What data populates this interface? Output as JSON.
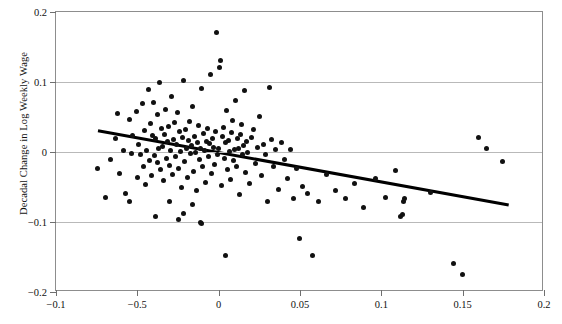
{
  "chart_data": {
    "type": "scatter",
    "title": "",
    "xlabel": "",
    "ylabel": "Decadal Change in Log Weekly Wage",
    "xlim": [
      -0.1,
      0.2
    ],
    "ylim": [
      -0.2,
      0.2
    ],
    "grid": true,
    "legend": null,
    "xticks": [
      -0.1,
      -0.05,
      0,
      0.05,
      0.1,
      0.15,
      0.2
    ],
    "xticklabels": [
      "−0.1",
      "−0.5",
      "0",
      "0.05",
      "0.1",
      "0.15",
      "0.2"
    ],
    "yticks": [
      0.2,
      0.1,
      0,
      -0.1,
      -0.2
    ],
    "yticklabels": [
      "0.2",
      "0.1",
      "0",
      "−0.1",
      "−0.2"
    ],
    "gridlines_y": [
      0.1,
      0,
      -0.1
    ],
    "marker": {
      "shape": "circle",
      "color": "#111111",
      "size_px": 5
    },
    "fit_line": {
      "color": "#000000",
      "width_px": 3,
      "x_start": -0.0742,
      "y_start": 0.0305,
      "x_end": 0.1783,
      "y_end": -0.0757,
      "slope": -0.4206,
      "intercept": -0.00071
    },
    "points": [
      [
        -0.0742,
        -0.0236
      ],
      [
        -0.0697,
        -0.0643
      ],
      [
        -0.0662,
        -0.0104
      ],
      [
        -0.0637,
        0.0196
      ],
      [
        -0.0612,
        -0.0314
      ],
      [
        -0.0588,
        0.0018
      ],
      [
        -0.057,
        -0.0586
      ],
      [
        -0.0551,
        0.0461
      ],
      [
        -0.0533,
        -0.0018
      ],
      [
        -0.0527,
        0.0232
      ],
      [
        -0.0508,
        0.0575
      ],
      [
        -0.0502,
        -0.0371
      ],
      [
        -0.049,
        0.0107
      ],
      [
        -0.0478,
        -0.0029
      ],
      [
        -0.0471,
        0.0686
      ],
      [
        -0.0465,
        -0.0214
      ],
      [
        -0.0453,
        0.0311
      ],
      [
        -0.0447,
        -0.0471
      ],
      [
        -0.0441,
        0.0018
      ],
      [
        -0.0434,
        0.0889
      ],
      [
        -0.0428,
        -0.0121
      ],
      [
        -0.0416,
        0.0404
      ],
      [
        -0.041,
        -0.0336
      ],
      [
        -0.0404,
        0.0239
      ],
      [
        -0.0398,
        0.0704
      ],
      [
        -0.0392,
        -0.0046
      ],
      [
        -0.0386,
        0.0193
      ],
      [
        -0.0379,
        0.0532
      ],
      [
        -0.0373,
        -0.0154
      ],
      [
        -0.0367,
        0.0046
      ],
      [
        -0.0361,
        0.0996
      ],
      [
        -0.0355,
        -0.025
      ],
      [
        -0.0349,
        0.0336
      ],
      [
        -0.0343,
        0.0079
      ],
      [
        -0.0337,
        -0.0411
      ],
      [
        -0.033,
        0.0254
      ],
      [
        -0.0324,
        0.0604
      ],
      [
        -0.0318,
        -0.0086
      ],
      [
        -0.0312,
        0.0146
      ],
      [
        -0.0306,
        0.0361
      ],
      [
        -0.03,
        -0.0196
      ],
      [
        -0.0294,
        0.0025
      ],
      [
        -0.0288,
        0.0796
      ],
      [
        -0.0282,
        -0.0325
      ],
      [
        -0.0276,
        0.0182
      ],
      [
        -0.0269,
        0.0425
      ],
      [
        -0.0263,
        -0.0061
      ],
      [
        -0.0257,
        0.0104
      ],
      [
        -0.0251,
        0.0571
      ],
      [
        -0.0245,
        -0.0229
      ],
      [
        -0.0239,
        0.0293
      ],
      [
        -0.0233,
        0.0011
      ],
      [
        -0.0227,
        -0.05
      ],
      [
        -0.022,
        0.0207
      ],
      [
        -0.0214,
        0.1018
      ],
      [
        -0.0208,
        -0.0139
      ],
      [
        -0.0202,
        0.0318
      ],
      [
        -0.0196,
        0.0057
      ],
      [
        -0.019,
        -0.0361
      ],
      [
        -0.0184,
        0.0171
      ],
      [
        -0.0178,
        0.0439
      ],
      [
        -0.0172,
        -0.0018
      ],
      [
        -0.0165,
        0.0089
      ],
      [
        -0.0159,
        0.0646
      ],
      [
        -0.0153,
        -0.0279
      ],
      [
        -0.0147,
        0.0225
      ],
      [
        -0.0141,
        0.0
      ],
      [
        -0.0135,
        -0.0554
      ],
      [
        -0.0129,
        0.0136
      ],
      [
        -0.0123,
        0.0382
      ],
      [
        -0.0117,
        -0.0104
      ],
      [
        -0.011,
        0.0046
      ],
      [
        -0.0104,
        0.0911
      ],
      [
        -0.0098,
        -0.0204
      ],
      [
        -0.0092,
        0.0261
      ],
      [
        -0.0086,
        0.0018
      ],
      [
        -0.008,
        -0.0432
      ],
      [
        -0.0074,
        0.0154
      ],
      [
        -0.0068,
        0.0339
      ],
      [
        -0.0061,
        -0.0068
      ],
      [
        -0.0055,
        0.0118
      ],
      [
        -0.0049,
        0.1107
      ],
      [
        -0.0043,
        -0.0307
      ],
      [
        -0.0037,
        0.0196
      ],
      [
        -0.0031,
        0.0071
      ],
      [
        -0.0025,
        -0.0175
      ],
      [
        -0.0018,
        0.0286
      ],
      [
        -0.0012,
        0.1704
      ],
      [
        -0.0006,
        -0.0029
      ],
      [
        0.0,
        0.0043
      ],
      [
        0.0006,
        0.1204
      ],
      [
        0.0012,
        0.1311
      ],
      [
        0.0018,
        -0.0482
      ],
      [
        0.0025,
        0.0221
      ],
      [
        0.0031,
        0.0357
      ],
      [
        0.0037,
        -0.0093
      ],
      [
        0.0043,
        0.0129
      ],
      [
        0.0049,
        0.0593
      ],
      [
        0.0055,
        -0.025
      ],
      [
        0.0061,
        0.0168
      ],
      [
        0.0068,
        0.0011
      ],
      [
        0.0074,
        -0.0396
      ],
      [
        0.008,
        0.0275
      ],
      [
        0.0086,
        0.0454
      ],
      [
        0.0092,
        -0.0121
      ],
      [
        0.0098,
        0.0036
      ],
      [
        0.0104,
        0.0736
      ],
      [
        0.011,
        -0.0214
      ],
      [
        0.0117,
        0.0186
      ],
      [
        0.0123,
        0.0057
      ],
      [
        0.0129,
        -0.0604
      ],
      [
        0.0135,
        0.0243
      ],
      [
        0.0141,
        0.0393
      ],
      [
        0.0147,
        -0.0036
      ],
      [
        0.0153,
        0.0093
      ],
      [
        0.0159,
        0.0875
      ],
      [
        0.0165,
        -0.0289
      ],
      [
        0.0172,
        0.015
      ],
      [
        0.0178,
        0.0
      ],
      [
        0.019,
        -0.0443
      ],
      [
        0.0202,
        0.0207
      ],
      [
        0.0214,
        0.0321
      ],
      [
        0.0227,
        -0.0161
      ],
      [
        0.0239,
        0.0068
      ],
      [
        0.0251,
        0.0511
      ],
      [
        0.0263,
        -0.0336
      ],
      [
        0.0276,
        0.0111
      ],
      [
        0.0288,
        -0.0029
      ],
      [
        0.03,
        -0.07
      ],
      [
        0.0312,
        0.0918
      ],
      [
        0.0324,
        0.0182
      ],
      [
        0.0337,
        -0.0211
      ],
      [
        0.0349,
        0.0029
      ],
      [
        0.0367,
        -0.0529
      ],
      [
        0.0386,
        0.0136
      ],
      [
        0.0404,
        -0.0107
      ],
      [
        0.0422,
        -0.0375
      ],
      [
        0.0441,
        0.0036
      ],
      [
        0.0459,
        -0.0664
      ],
      [
        0.0478,
        -0.0239
      ],
      [
        0.0496,
        -0.1232
      ],
      [
        0.0515,
        -0.0486
      ],
      [
        0.0545,
        -0.0589
      ],
      [
        0.0576,
        -0.1479
      ],
      [
        0.0612,
        -0.0714
      ],
      [
        0.0661,
        -0.0321
      ],
      [
        0.0716,
        -0.0546
      ],
      [
        0.0777,
        -0.0661
      ],
      [
        0.0832,
        -0.0457
      ],
      [
        0.0893,
        -0.0789
      ],
      [
        0.0966,
        -0.0379
      ],
      [
        0.1027,
        -0.065
      ],
      [
        0.1088,
        -0.0261
      ],
      [
        0.1119,
        -0.0925
      ],
      [
        0.1131,
        -0.0886
      ],
      [
        0.1137,
        -0.07
      ],
      [
        0.1143,
        -0.0661
      ],
      [
        0.1302,
        -0.0575
      ],
      [
        0.1442,
        -0.1596
      ],
      [
        0.1497,
        -0.175
      ],
      [
        0.1595,
        0.0204
      ],
      [
        0.1649,
        0.0043
      ],
      [
        0.1746,
        -0.0132
      ],
      [
        -0.0386,
        -0.0918
      ],
      [
        -0.0245,
        -0.0968
      ],
      [
        -0.0104,
        -0.1025
      ],
      [
        -0.011,
        -0.1
      ],
      [
        0.0043,
        -0.1475
      ],
      [
        -0.0551,
        -0.0711
      ],
      [
        -0.0624,
        0.0543
      ],
      [
        -0.0214,
        -0.0875
      ],
      [
        -0.03,
        -0.07
      ],
      [
        -0.0159,
        -0.0754
      ]
    ]
  }
}
